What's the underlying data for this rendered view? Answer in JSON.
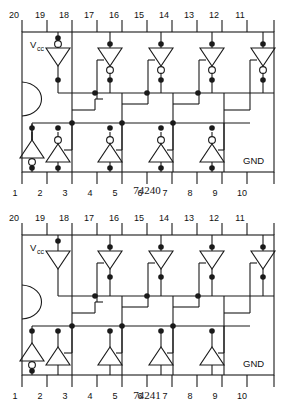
{
  "page": {
    "background": "#ffffff",
    "ink": "#111111",
    "line_color": "#1a1a1a"
  },
  "diagrams": [
    {
      "id": "74240",
      "caption": "74240",
      "power_label": "V",
      "power_sub": "cc",
      "ground_label": "GND",
      "top_pins": [
        "20",
        "19",
        "18",
        "17",
        "16",
        "15",
        "14",
        "13",
        "12",
        "11"
      ],
      "bottom_pins": [
        "1",
        "2",
        "3",
        "4",
        "5",
        "6",
        "7",
        "8",
        "9",
        "10"
      ],
      "top_gates": [
        {
          "pin": "19",
          "type": "inverter",
          "bubble": "input",
          "direction": "down",
          "enable": "none"
        },
        {
          "pin": "17",
          "type": "inverter",
          "bubble": "output",
          "direction": "down",
          "enable": "left"
        },
        {
          "pin": "15",
          "type": "inverter",
          "bubble": "output",
          "direction": "down",
          "enable": "left"
        },
        {
          "pin": "13",
          "type": "inverter",
          "bubble": "output",
          "direction": "down",
          "enable": "left"
        },
        {
          "pin": "11",
          "type": "inverter",
          "bubble": "output",
          "direction": "down",
          "enable": "left"
        }
      ],
      "bottom_gates": [
        {
          "pin": "1",
          "type": "inverter",
          "bubble": "output",
          "direction": "up",
          "enable": "none"
        },
        {
          "pin": "2",
          "type": "inverter",
          "bubble": "input",
          "direction": "up",
          "enable": "right"
        },
        {
          "pin": "4",
          "type": "inverter",
          "bubble": "input",
          "direction": "up",
          "enable": "right"
        },
        {
          "pin": "6",
          "type": "inverter",
          "bubble": "input",
          "direction": "up",
          "enable": "right"
        },
        {
          "pin": "8",
          "type": "inverter",
          "bubble": "input",
          "direction": "up",
          "enable": "right"
        }
      ]
    },
    {
      "id": "74241",
      "caption": "74241",
      "power_label": "V",
      "power_sub": "cc",
      "ground_label": "GND",
      "top_pins": [
        "20",
        "19",
        "18",
        "17",
        "16",
        "15",
        "14",
        "13",
        "12",
        "11"
      ],
      "bottom_pins": [
        "1",
        "2",
        "3",
        "4",
        "5",
        "6",
        "7",
        "8",
        "9",
        "10"
      ],
      "top_gates": [
        {
          "pin": "19",
          "type": "buffer",
          "bubble": "none",
          "direction": "down",
          "enable": "none"
        },
        {
          "pin": "17",
          "type": "buffer",
          "bubble": "none",
          "direction": "down",
          "enable": "left"
        },
        {
          "pin": "15",
          "type": "buffer",
          "bubble": "none",
          "direction": "down",
          "enable": "left"
        },
        {
          "pin": "13",
          "type": "buffer",
          "bubble": "none",
          "direction": "down",
          "enable": "left"
        },
        {
          "pin": "11",
          "type": "buffer",
          "bubble": "none",
          "direction": "down",
          "enable": "left"
        }
      ],
      "bottom_gates": [
        {
          "pin": "1",
          "type": "inverter",
          "bubble": "output",
          "direction": "up",
          "enable": "none"
        },
        {
          "pin": "2",
          "type": "buffer",
          "bubble": "none",
          "direction": "up",
          "enable": "right"
        },
        {
          "pin": "4",
          "type": "buffer",
          "bubble": "none",
          "direction": "up",
          "enable": "right"
        },
        {
          "pin": "6",
          "type": "buffer",
          "bubble": "none",
          "direction": "up",
          "enable": "right"
        },
        {
          "pin": "8",
          "type": "buffer",
          "bubble": "none",
          "direction": "up",
          "enable": "right"
        }
      ]
    }
  ]
}
